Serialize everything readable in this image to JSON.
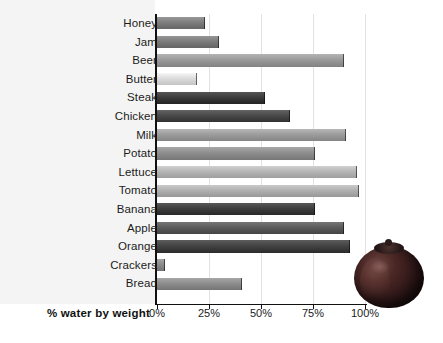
{
  "chart_data": {
    "type": "bar",
    "orientation": "horizontal",
    "title": "",
    "xlabel": "% water by weight",
    "ylabel": "",
    "xlim": [
      0,
      100
    ],
    "xticks": [
      "0%",
      "25%",
      "50%",
      "75%",
      "100%"
    ],
    "xtick_values": [
      0,
      25,
      50,
      75,
      100
    ],
    "grid": true,
    "legend": null,
    "categories": [
      "Honey",
      "Jam",
      "Beer",
      "Butter",
      "Steak",
      "Chicken",
      "Milk",
      "Potato",
      "Lettuce",
      "Tomato",
      "Banana",
      "Apple",
      "Orange",
      "Crackers",
      "Bread"
    ],
    "values": [
      23,
      30,
      90,
      19,
      52,
      64,
      91,
      76,
      96,
      97,
      76,
      90,
      93,
      4,
      41
    ],
    "bar_colors": [
      "#7e7e7e",
      "#7c7c7c",
      "#9a9a9a",
      "#dcdcdc",
      "#3b3b3b",
      "#4a4a4a",
      "#9d9d9d",
      "#8e8e8e",
      "#b6b6b6",
      "#b0b0b0",
      "#3f3f3f",
      "#5c5c5c",
      "#434343",
      "#8b8b8b",
      "#8d8d8d"
    ]
  },
  "decoration": {
    "photo_name": "tomato-photograph",
    "panel_color": "#f4f4f4",
    "axis_color": "#111111",
    "grid_color": "#e2e2e2"
  }
}
